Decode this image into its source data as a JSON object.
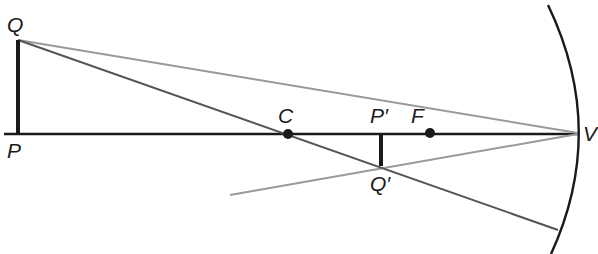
{
  "diagram": {
    "type": "concave-mirror-ray-diagram",
    "colors": {
      "axis": "#1a1a1a",
      "object": "#1a1a1a",
      "image": "#1a1a1a",
      "mirror": "#1a1a1a",
      "ray_center": "#555555",
      "ray_vertex": "#9a9a9a"
    },
    "labels": {
      "object_top": "Q",
      "object_base": "P",
      "center": "C",
      "image_base": "P′",
      "focus": "F",
      "vertex": "V",
      "image_top": "Q′"
    },
    "points": {
      "Q": [
        18,
        40
      ],
      "P": [
        18,
        134
      ],
      "C": [
        288,
        134
      ],
      "P_prime": [
        381,
        134
      ],
      "F": [
        430,
        134
      ],
      "V": [
        578,
        134
      ],
      "Q_prime": [
        381,
        165
      ]
    }
  }
}
